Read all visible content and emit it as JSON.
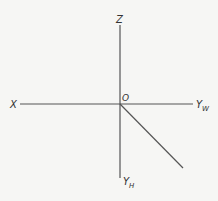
{
  "diagram": {
    "type": "axis-projection",
    "labels": {
      "z": "Z",
      "x": "X",
      "origin": "O",
      "yw_base": "Y",
      "yw_sub": "W",
      "yh_base": "Y",
      "yh_sub": "H"
    },
    "colors": {
      "background": "#f6f6f4",
      "line": "#555555",
      "text": "#333333"
    }
  }
}
